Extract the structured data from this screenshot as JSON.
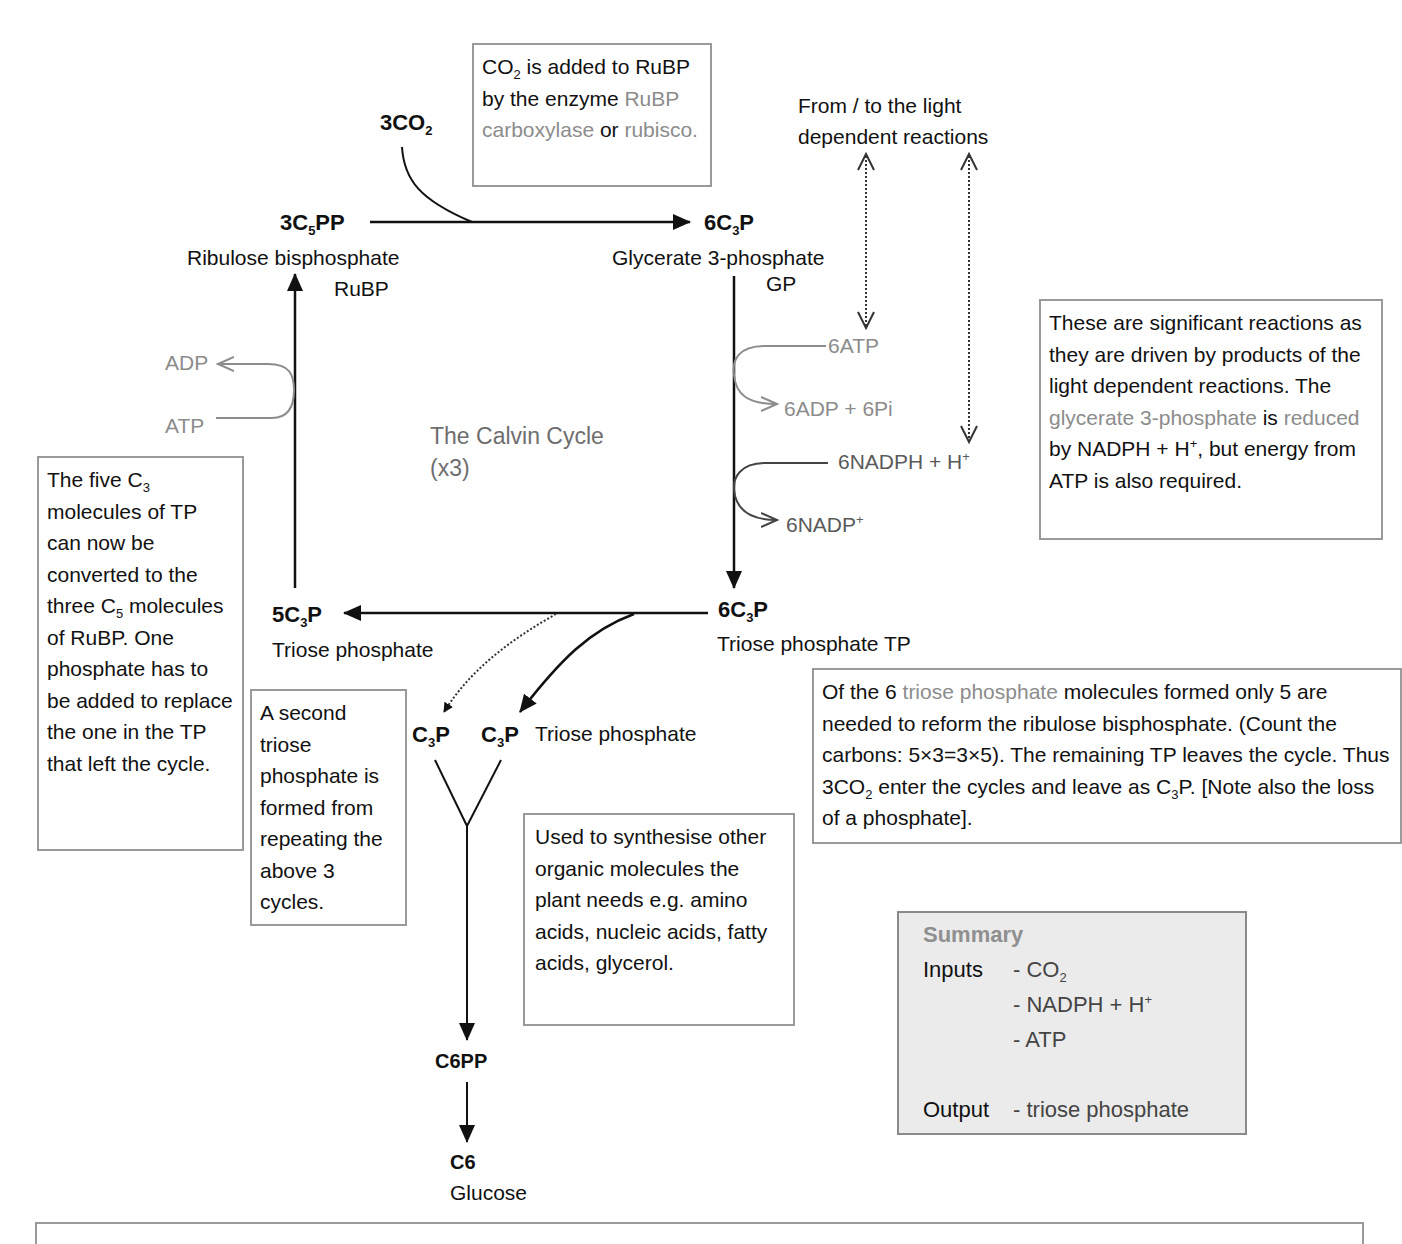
{
  "title": "The Calvin Cycle",
  "subtitle": "(x3)",
  "colors": {
    "highlight_text": "#8c8c8c",
    "box_border": "#9a9a9a",
    "summary_bg": "#ebebeb",
    "arrow": "#111111",
    "grey_arrow": "#8c8c8c"
  },
  "nodes": {
    "co2_input": {
      "formula": "3CO",
      "sub": "2"
    },
    "rubp": {
      "formula_pre": "3C",
      "sub": "5",
      "formula_post": "PP",
      "name": "Ribulose bisphosphate",
      "abbr": "RuBP"
    },
    "gp": {
      "formula_pre": "6C",
      "sub": "3",
      "formula_post": "P",
      "name": "Glycerate 3-phosphate",
      "abbr": "GP"
    },
    "tp6": {
      "formula_pre": "6C",
      "sub": "3",
      "formula_post": "P",
      "name": "Triose phosphate TP"
    },
    "tp5": {
      "formula_pre": "5C",
      "sub": "3",
      "formula_post": "P",
      "name": "Triose phosphate"
    },
    "c3p_a": {
      "formula_pre": "C",
      "sub": "3",
      "formula_post": "P"
    },
    "c3p_b": {
      "formula_pre": "C",
      "sub": "3",
      "formula_post": "P",
      "name": "Triose phosphate"
    },
    "c6pp": {
      "formula": "C6PP"
    },
    "c6": {
      "formula": "C6",
      "name": "Glucose"
    }
  },
  "side_reactions": {
    "atp_in": "6ATP",
    "adp_out": "6ADP + 6Pi",
    "nadph_in": "6NADPH + H",
    "nadph_sup": "+",
    "nadp_out": "6NADP",
    "nadp_sup": "+",
    "regen_adp": "ADP",
    "regen_atp": "ATP"
  },
  "light_reactions_label": {
    "line1": "From / to the light",
    "line2": "dependent reactions"
  },
  "boxes": {
    "rubisco": {
      "t1": "CO",
      "t1_sub": "2",
      "t2": " is added to RuBP by the enzyme ",
      "hl1": "RuBP carboxylase",
      "t3": " or ",
      "hl2": "rubisco."
    },
    "significant": {
      "t1": "These are significant reactions as they are driven by products of the light dependent reactions. The ",
      "hl1": "glycerate 3-phosphate",
      "t2": " is ",
      "hl2": "reduced",
      "t3": " by NADPH + H",
      "t3_sup": "+",
      "t4": ", but energy from ATP is also required."
    },
    "five_c3": {
      "t1": "The five C",
      "t1_sub": "3",
      "t2": " molecules of TP can now be converted to the three C",
      "t2_sub": "5",
      "t3": " molecules of RuBP. One phosphate has to be added to replace the one in the TP that left the cycle."
    },
    "second_tp": {
      "text": "A second triose phosphate is formed from repeating the above 3 cycles."
    },
    "of_the_six": {
      "t1": "Of the 6 ",
      "hl1": "triose phosphate",
      "t2": " molecules formed only 5 are needed to reform the ribulose bisphosphate. (Count the carbons: 5×3=3×5). The remaining TP leaves the cycle. Thus 3CO",
      "t2_sub": "2",
      "t3": " enter the cycles and leave as C",
      "t3_sub": "3",
      "t4": "P. [Note also the loss of a phosphate]."
    },
    "synthesise": {
      "text": "Used to synthesise other organic molecules the plant needs e.g. amino acids, nucleic acids, fatty acids, glycerol."
    }
  },
  "summary": {
    "title": "Summary",
    "inputs_label": "Inputs",
    "inputs": [
      {
        "text": "- CO",
        "sub": "2"
      },
      {
        "text": "- NADPH + H",
        "sup": "+"
      },
      {
        "text": "- ATP"
      }
    ],
    "output_label": "Output",
    "output": "- triose phosphate"
  }
}
